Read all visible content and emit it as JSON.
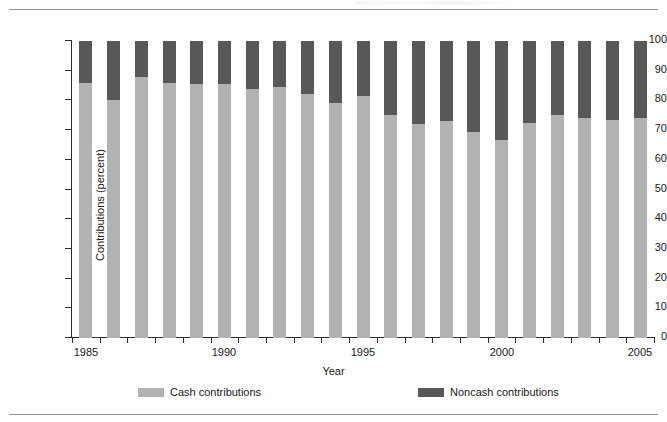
{
  "chart_data": {
    "type": "bar",
    "subtype": "stacked-100-percent",
    "title": "",
    "xlabel": "Year",
    "ylabel": "Contributions (percent)",
    "ylim": [
      0,
      100
    ],
    "ytick_labels": [
      "100",
      "90",
      "80",
      "70",
      "60",
      "50",
      "40",
      "30",
      "20",
      "10",
      "0"
    ],
    "ytick_values": [
      100,
      90,
      80,
      70,
      60,
      50,
      40,
      30,
      20,
      10,
      0
    ],
    "xtick_labels": [
      "1985",
      "1990",
      "1995",
      "2000",
      "2005"
    ],
    "xtick_values": [
      1985,
      1990,
      1995,
      2000,
      2005
    ],
    "grid": false,
    "legend_position": "bottom",
    "categories": [
      1985,
      1986,
      1987,
      1988,
      1989,
      1990,
      1991,
      1992,
      1993,
      1994,
      1995,
      1996,
      1997,
      1998,
      1999,
      2000,
      2001,
      2002,
      2003,
      2004,
      2005
    ],
    "series": [
      {
        "name": "Cash contributions",
        "color": "#b2b2b2",
        "values": [
          86,
          80,
          88,
          86,
          85.5,
          85.5,
          84,
          84.5,
          82,
          79,
          81.5,
          75,
          72,
          73,
          69.5,
          66.5,
          72.5,
          75,
          74,
          73.5,
          74
        ]
      },
      {
        "name": "Noncash contributions",
        "color": "#585858",
        "values": [
          14,
          20,
          12,
          14,
          14.5,
          14.5,
          16,
          15.5,
          18,
          21,
          18.5,
          25,
          28,
          27,
          30.5,
          33.5,
          27.5,
          25,
          26,
          26.5,
          26
        ]
      }
    ]
  },
  "legend": {
    "items": [
      {
        "label": "Cash contributions",
        "color": "#b2b2b2"
      },
      {
        "label": "Noncash contributions",
        "color": "#585858"
      }
    ]
  },
  "colors": {
    "cash": "#b2b2b2",
    "noncash": "#585858",
    "axis": "#2b2b2b",
    "rule": "#8f8f8f",
    "background": "#ffffff"
  }
}
